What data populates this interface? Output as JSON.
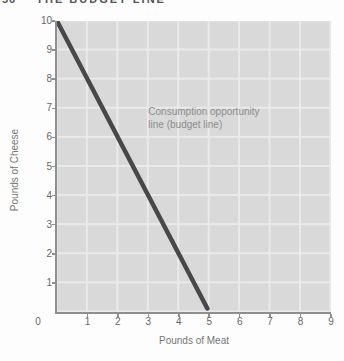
{
  "page": {
    "header": {
      "page_number": "56",
      "title": "THE BUDGET LINE"
    }
  },
  "chart_data": {
    "type": "line",
    "title": "",
    "xlabel": "Pounds of Meat",
    "ylabel": "Pounds of Cheese",
    "xlim": [
      0,
      9
    ],
    "ylim": [
      0,
      10
    ],
    "x_ticks": [
      0,
      1,
      2,
      3,
      4,
      5,
      6,
      7,
      8,
      9
    ],
    "y_ticks": [
      1,
      2,
      3,
      4,
      5,
      6,
      7,
      8,
      9,
      10
    ],
    "origin_label": "0",
    "grid": true,
    "legend": "none",
    "series": [
      {
        "name": "Consumption opportunity line (budget line)",
        "x": [
          0,
          5
        ],
        "y": [
          10,
          0
        ],
        "color": "#48484b"
      }
    ],
    "annotation": {
      "lines": [
        "Consumption opportunity",
        "line (budget line)"
      ],
      "x": 3.0,
      "y": 7.1
    }
  },
  "colors": {
    "plot_bg": "#d9d9d9",
    "grid": "#eaeaea",
    "axis": "#8f8f8f",
    "line": "#48484b",
    "tick_text": "#666666",
    "title_text": "#757575",
    "annotation_text": "#8c8c8c",
    "header_text": "#555555"
  }
}
